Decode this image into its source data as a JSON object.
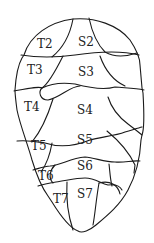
{
  "diagram": {
    "title": "",
    "labels": {
      "T2": "T2",
      "T3": "T3",
      "T4": "T4",
      "T5": "T5",
      "T6": "T6",
      "T7": "T7",
      "S2": "S2",
      "S3": "S3",
      "S4": "S4",
      "S5": "S5",
      "S6": "S6",
      "S7": "S7"
    },
    "colors": {
      "stroke": "#1a1a1a",
      "background": "#ffffff",
      "text": "#222222"
    }
  }
}
